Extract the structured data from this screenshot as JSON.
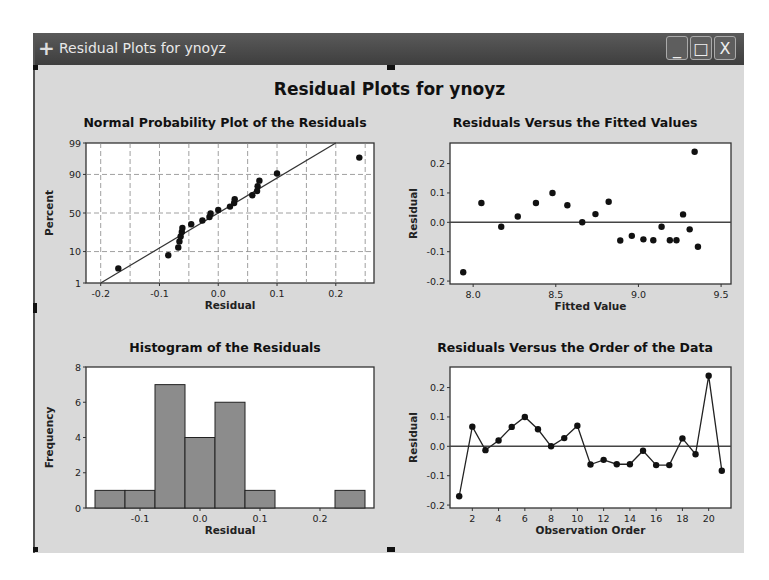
{
  "window": {
    "title": "Residual Plots for ynoyz",
    "icons": {
      "app": "plus-icon",
      "minimize": "minimize-icon",
      "maximize": "maximize-icon",
      "close": "close-icon"
    },
    "buttons": {
      "minimize": "_",
      "maximize": "□",
      "close": "X"
    }
  },
  "figure": {
    "title": "Residual Plots for ynoyz"
  },
  "chart_data": [
    {
      "type": "scatter",
      "title": "Normal Probability Plot of the Residuals",
      "xlabel": "Residual",
      "ylabel": "Percent",
      "xlim": [
        -0.225,
        0.265
      ],
      "xticks": [
        "-0.2",
        "-0.1",
        "0.0",
        "0.1",
        "0.2"
      ],
      "yticks": [
        "1",
        "10",
        "50",
        "90",
        "99"
      ],
      "grid": true,
      "reference_line": {
        "from": [
          -0.2,
          1
        ],
        "to": [
          0.2,
          99
        ]
      },
      "points": [
        [
          -0.17,
          3.3
        ],
        [
          -0.085,
          8.0
        ],
        [
          -0.068,
          12.6
        ],
        [
          -0.066,
          17.2
        ],
        [
          -0.064,
          21.8
        ],
        [
          -0.062,
          26.4
        ],
        [
          -0.061,
          30.9
        ],
        [
          -0.046,
          35.5
        ],
        [
          -0.027,
          40.1
        ],
        [
          -0.015,
          44.7
        ],
        [
          -0.013,
          49.3
        ],
        [
          0.0,
          53.9
        ],
        [
          0.02,
          58.4
        ],
        [
          0.027,
          63.0
        ],
        [
          0.028,
          67.6
        ],
        [
          0.058,
          72.2
        ],
        [
          0.066,
          76.8
        ],
        [
          0.067,
          81.4
        ],
        [
          0.07,
          85.9
        ],
        [
          0.1,
          90.5
        ],
        [
          0.24,
          96.7
        ]
      ]
    },
    {
      "type": "scatter",
      "title": "Residuals Versus the Fitted Values",
      "xlabel": "Fitted Value",
      "ylabel": "Residual",
      "xlim": [
        7.86,
        9.56
      ],
      "ylim": [
        -0.21,
        0.27
      ],
      "xticks": [
        "8.0",
        "8.5",
        "9.0",
        "9.5"
      ],
      "yticks": [
        "-0.2",
        "-0.1",
        "0.0",
        "0.1",
        "0.2"
      ],
      "reference_line_y": 0,
      "x": [
        7.94,
        8.05,
        8.17,
        8.27,
        8.38,
        8.48,
        8.57,
        8.66,
        8.74,
        8.82,
        8.89,
        8.96,
        9.03,
        9.09,
        9.14,
        9.19,
        9.23,
        9.27,
        9.31,
        9.34,
        9.36
      ],
      "y": [
        -0.17,
        0.066,
        -0.015,
        0.02,
        0.066,
        0.1,
        0.058,
        0.0,
        0.028,
        0.07,
        -0.062,
        -0.046,
        -0.058,
        -0.061,
        -0.015,
        -0.061,
        -0.061,
        0.027,
        -0.024,
        0.24,
        -0.083
      ]
    },
    {
      "type": "bar",
      "title": "Histogram of the Residuals",
      "xlabel": "Residual",
      "ylabel": "Frequency",
      "ylim": [
        0,
        8
      ],
      "xticks": [
        "-0.1",
        "0.0",
        "0.1",
        "0.2"
      ],
      "yticks": [
        "0",
        "2",
        "4",
        "6",
        "8"
      ],
      "bin_width": 0.05,
      "categories": [
        "-0.15",
        "-0.10",
        "-0.05",
        "0.00",
        "0.05",
        "0.10",
        "0.15",
        "0.20",
        "0.25"
      ],
      "values": [
        1,
        1,
        7,
        4,
        6,
        1,
        0,
        0,
        1
      ]
    },
    {
      "type": "line",
      "title": "Residuals Versus the Order of the Data",
      "xlabel": "Observation Order",
      "ylabel": "Residual",
      "ylim": [
        -0.21,
        0.27
      ],
      "xticks": [
        "2",
        "4",
        "6",
        "8",
        "10",
        "12",
        "14",
        "16",
        "18",
        "20"
      ],
      "yticks": [
        "-0.2",
        "-0.1",
        "0.0",
        "0.1",
        "0.2"
      ],
      "reference_line_y": 0,
      "x": [
        1,
        2,
        3,
        4,
        5,
        6,
        7,
        8,
        9,
        10,
        11,
        12,
        13,
        14,
        15,
        16,
        17,
        18,
        19,
        20,
        21
      ],
      "y": [
        -0.17,
        0.067,
        -0.013,
        0.02,
        0.066,
        0.1,
        0.058,
        0.0,
        0.028,
        0.07,
        -0.062,
        -0.046,
        -0.061,
        -0.061,
        -0.015,
        -0.064,
        -0.064,
        0.027,
        -0.027,
        0.24,
        -0.083
      ]
    }
  ]
}
